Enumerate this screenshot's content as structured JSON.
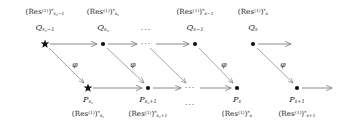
{
  "diagram": {
    "colors": {
      "node": "#111111",
      "arrow": "#7d7d7d",
      "text": "#1d1d1d",
      "background": "#ffffff"
    },
    "map_label": "φ",
    "ellipsis": "···",
    "top_row": {
      "nodes": [
        {
          "id": "q-s0-minus-1",
          "marker": "star",
          "x": 45,
          "y": 44,
          "upper_label_html": "(Res<sup>(1)</sup>)<sup>*</sup><sub class=\"sub-it\">s<sub>0</sub>−1</sub>",
          "name_label_html": "Q<sub class=\"sub-it\">s<sub>0</sub>−1</sub>",
          "upper_label_text": "(Res^(1))*_{s_0-1}",
          "name_label_text": "Q_{s_0-1}"
        },
        {
          "id": "q-s0",
          "marker": "dot",
          "x": 103,
          "y": 44,
          "upper_label_html": "(Res<sup>(1)</sup>)<sup>*</sup><sub class=\"sub-it\">s<sub>0</sub></sub>",
          "name_label_html": "Q<sub class=\"sub-it\">s<sub>0</sub></sub>",
          "upper_label_text": "(Res^(1))*_{s_0}",
          "name_label_text": "Q_{s_0}"
        },
        {
          "id": "q-s-minus-1",
          "marker": "dot",
          "x": 195,
          "y": 44,
          "upper_label_html": "(Res<sup>(1)</sup>)<sup>*</sup><sub class=\"sub-it\">s−1</sub>",
          "name_label_html": "Q<sub class=\"sub-it\">s−1</sub>",
          "upper_label_text": "(Res^(1))*_{s-1}",
          "name_label_text": "Q_{s-1}"
        },
        {
          "id": "q-s",
          "marker": "dot",
          "x": 253,
          "y": 44,
          "upper_label_html": "(Res<sup>(1)</sup>)<sup>*</sup><sub class=\"sub-it\">s</sub>",
          "name_label_html": "Q<sub class=\"sub-it\">s</sub>",
          "upper_label_text": "(Res^(1))*_s",
          "name_label_text": "Q_s"
        }
      ],
      "ellipsis_x": 146,
      "ellipsis_y": 44,
      "name_ellipsis_x": 146,
      "name_ellipsis_y": 26
    },
    "bottom_row": {
      "nodes": [
        {
          "id": "p-s0",
          "marker": "star",
          "x": 88,
          "y": 88,
          "name_label_html": "P<sub class=\"sub-it\">s<sub>0</sub></sub>",
          "lower_label_html": "(Res<sup>(1)</sup>)<sup>*</sup><sub class=\"sub-it\">s<sub>0</sub></sub>",
          "name_label_text": "P_{s_0}",
          "lower_label_text": "(Res^(1))*_{s_0}"
        },
        {
          "id": "p-s0-plus-1",
          "marker": "dot",
          "x": 148,
          "y": 88,
          "name_label_html": "P<sub class=\"sub-it\">s<sub>0</sub>+1</sub>",
          "lower_label_html": "(Res<sup>(1)</sup>)<sup>*</sup><sub class=\"sub-it\">s<sub>0</sub>+1</sub>",
          "name_label_text": "P_{s_0+1}",
          "lower_label_text": "(Res^(1))*_{s_0+1}"
        },
        {
          "id": "p-s",
          "marker": "dot",
          "x": 237,
          "y": 88,
          "name_label_html": "P<sub class=\"sub-it\">s</sub>",
          "lower_label_html": "(Res<sup>(1)</sup>)<sup>*</sup><sub class=\"sub-it\">s</sub>",
          "name_label_text": "P_s",
          "lower_label_text": "(Res^(1))*_s"
        },
        {
          "id": "p-s-plus-1",
          "marker": "dot",
          "x": 297,
          "y": 88,
          "name_label_html": "P<sub class=\"sub-it\">s+1</sub>",
          "lower_label_html": "(Res<sup>(1)</sup>)<sup>*</sup><sub class=\"sub-it\">s+1</sub>",
          "name_label_text": "P_{s+1}",
          "lower_label_text": "(Res^(1))*_{s+1}"
        }
      ],
      "ellipsis_x": 190,
      "ellipsis_y": 88,
      "name_ellipsis_x": 190,
      "name_ellipsis_y": 104
    },
    "horizontal_arrows": [
      {
        "id": "top-arrow-1",
        "x1": 50,
        "y1": 44,
        "x2": 97,
        "y2": 44
      },
      {
        "id": "top-arrow-2",
        "x1": 108,
        "y1": 44,
        "x2": 137,
        "y2": 44
      },
      {
        "id": "top-arrow-3",
        "x1": 156,
        "y1": 44,
        "x2": 189,
        "y2": 44
      },
      {
        "id": "top-arrow-4",
        "x1": 258,
        "y1": 44,
        "x2": 291,
        "y2": 44
      },
      {
        "id": "bottom-arrow-1",
        "x1": 93,
        "y1": 88,
        "x2": 142,
        "y2": 88
      },
      {
        "id": "bottom-arrow-2",
        "x1": 153,
        "y1": 88,
        "x2": 181,
        "y2": 88
      },
      {
        "id": "bottom-arrow-3",
        "x1": 200,
        "y1": 88,
        "x2": 231,
        "y2": 88
      },
      {
        "id": "bottom-arrow-4",
        "x1": 302,
        "y1": 88,
        "x2": 332,
        "y2": 88
      }
    ],
    "diagonal_arrows": [
      {
        "id": "phi-1",
        "x1": 49,
        "y1": 48,
        "x2": 84,
        "y2": 83,
        "label": "φ",
        "label_x": 75,
        "label_y": 61,
        "has_label": true
      },
      {
        "id": "phi-2",
        "x1": 107,
        "y1": 48,
        "x2": 144,
        "y2": 83,
        "label": "φ",
        "label_x": 133,
        "label_y": 61,
        "has_label": true
      },
      {
        "id": "phi-3",
        "x1": 150,
        "y1": 48,
        "x2": 186,
        "y2": 83,
        "label": "",
        "label_x": 0,
        "label_y": 0,
        "has_label": false
      },
      {
        "id": "phi-4",
        "x1": 199,
        "y1": 48,
        "x2": 233,
        "y2": 83,
        "label": "φ",
        "label_x": 224,
        "label_y": 61,
        "has_label": true
      },
      {
        "id": "phi-5",
        "x1": 257,
        "y1": 48,
        "x2": 293,
        "y2": 83,
        "label": "φ",
        "label_x": 283,
        "label_y": 61,
        "has_label": true
      }
    ]
  }
}
